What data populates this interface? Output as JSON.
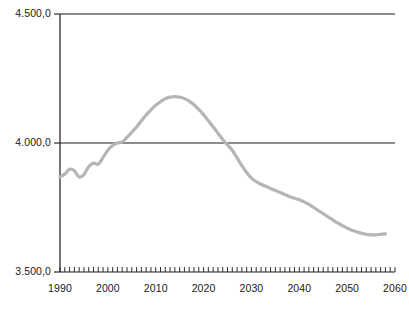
{
  "chart_data": {
    "type": "line",
    "title": "",
    "subtitle": "",
    "xlabel": "",
    "ylabel": "",
    "xlim": [
      1990,
      2060
    ],
    "ylim": [
      3500,
      4500
    ],
    "grid": true,
    "gridlines_y": [
      4000
    ],
    "legend": "none",
    "y_tick_labels": [
      "4.500,0",
      "4.000,0",
      "3.500,0"
    ],
    "y_tick_values": [
      4500,
      4000,
      3500
    ],
    "x_tick_labels": [
      "1990",
      "2000",
      "2010",
      "2020",
      "2030",
      "2040",
      "2050",
      "2060"
    ],
    "x_tick_values": [
      1990,
      2000,
      2010,
      2020,
      2030,
      2040,
      2050,
      2060
    ],
    "x_minor_tick_interval": 1,
    "line_color": "#b5b5b5",
    "axis_color": "#1a1a1a",
    "series": [
      {
        "name": "population",
        "x": [
          1990,
          1991,
          1992,
          1993,
          1994,
          1995,
          1996,
          1997,
          1998,
          1999,
          2000,
          2001,
          2002,
          2003,
          2004,
          2005,
          2006,
          2007,
          2008,
          2009,
          2010,
          2011,
          2012,
          2013,
          2014,
          2015,
          2016,
          2017,
          2018,
          2019,
          2020,
          2021,
          2022,
          2023,
          2024,
          2025,
          2026,
          2027,
          2028,
          2029,
          2030,
          2031,
          2032,
          2033,
          2034,
          2035,
          2036,
          2037,
          2038,
          2039,
          2040,
          2041,
          2042,
          2043,
          2044,
          2045,
          2046,
          2047,
          2048,
          2049,
          2050,
          2051,
          2052,
          2053,
          2054,
          2055,
          2056,
          2057,
          2058
        ],
        "values": [
          3868,
          3880,
          3898,
          3892,
          3868,
          3878,
          3908,
          3922,
          3918,
          3944,
          3972,
          3990,
          4000,
          4004,
          4022,
          4042,
          4062,
          4086,
          4108,
          4128,
          4146,
          4160,
          4172,
          4178,
          4180,
          4178,
          4172,
          4162,
          4148,
          4130,
          4110,
          4086,
          4062,
          4038,
          4014,
          3992,
          3972,
          3942,
          3912,
          3886,
          3864,
          3850,
          3840,
          3832,
          3824,
          3816,
          3808,
          3800,
          3792,
          3786,
          3780,
          3772,
          3762,
          3750,
          3738,
          3726,
          3714,
          3702,
          3690,
          3680,
          3670,
          3662,
          3656,
          3650,
          3646,
          3644,
          3644,
          3646,
          3648
        ]
      }
    ]
  },
  "axes": {
    "y_labels": [
      "4.500,0",
      "4.000,0",
      "3.500,0"
    ],
    "x_labels": [
      "1990",
      "2000",
      "2010",
      "2020",
      "2030",
      "2040",
      "2050",
      "2060"
    ]
  }
}
